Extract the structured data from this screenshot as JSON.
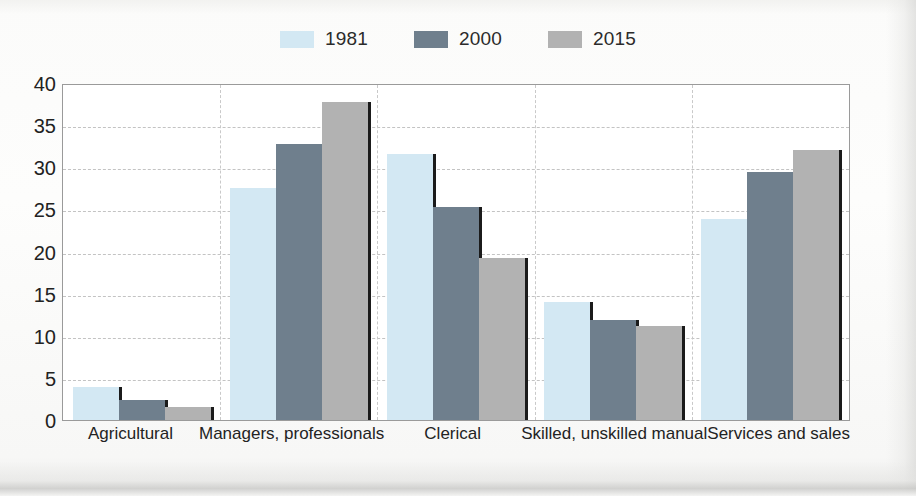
{
  "legend": {
    "items": [
      {
        "label": "1981",
        "color": "#d3e8f3",
        "icon": "legend-swatch-1981"
      },
      {
        "label": "2000",
        "color": "#6f7f8d",
        "icon": "legend-swatch-2000"
      },
      {
        "label": "2015",
        "color": "#b2b2b2",
        "icon": "legend-swatch-2015"
      }
    ]
  },
  "axis": {
    "y_ticks": [
      "0",
      "5",
      "10",
      "15",
      "20",
      "25",
      "30",
      "35",
      "40"
    ],
    "x_labels": [
      "Agricultural",
      "Managers, professionals",
      "Clerical",
      "Skilled, unskilled manual",
      "Services and sales"
    ]
  },
  "chart_data": {
    "type": "bar",
    "title": "",
    "xlabel": "",
    "ylabel": "",
    "ylim": [
      0,
      40
    ],
    "ytick_step": 5,
    "grid": true,
    "legend_position": "top-right",
    "categories": [
      "Agricultural",
      "Managers, professionals",
      "Clerical",
      "Skilled, unskilled manual",
      "Services and sales"
    ],
    "series": [
      {
        "name": "1981",
        "color": "#d3e8f3",
        "values": [
          4.0,
          27.7,
          31.8,
          14.1,
          24.0
        ]
      },
      {
        "name": "2000",
        "color": "#6f7f8d",
        "values": [
          2.4,
          33.0,
          25.4,
          12.0,
          29.6
        ]
      },
      {
        "name": "2015",
        "color": "#b2b2b2",
        "values": [
          1.6,
          38.0,
          19.3,
          11.2,
          32.3
        ]
      }
    ]
  }
}
